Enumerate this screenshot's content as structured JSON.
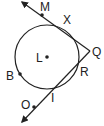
{
  "diagram": {
    "type": "geometry",
    "stroke_color": "#222222",
    "background": "#ffffff",
    "circle": {
      "center_label": "L",
      "cx": 47,
      "cy": 57,
      "r": 32
    },
    "points": {
      "L": {
        "label": "L",
        "x": 47,
        "y": 57
      },
      "M": {
        "label": "M",
        "x": 42,
        "y": 15
      },
      "X": {
        "label": "X",
        "x": 60,
        "y": 27
      },
      "Q": {
        "label": "Q",
        "x": 90,
        "y": 51
      },
      "R": {
        "label": "R",
        "x": 78,
        "y": 64
      },
      "I": {
        "label": "I",
        "x": 52,
        "y": 90
      },
      "O": {
        "label": "O",
        "x": 34,
        "y": 107
      },
      "B": {
        "label": "B",
        "x": 20,
        "y": 74
      }
    },
    "lines": [
      {
        "name": "ray-QM",
        "from": "Q",
        "toward": "M",
        "arrow_end": [
          22,
          2
        ]
      },
      {
        "name": "ray-QO",
        "from": "Q",
        "toward": "O",
        "arrow_end": [
          22,
          122
        ]
      }
    ]
  }
}
